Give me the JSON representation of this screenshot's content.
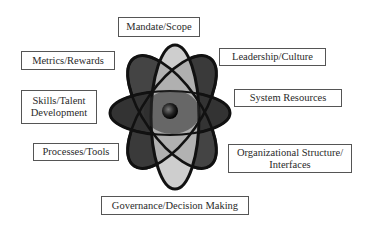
{
  "diagram": {
    "type": "atom-model",
    "center_element": "atom-icon",
    "labels": [
      {
        "id": "mandate",
        "lines": [
          "Mandate/Scope"
        ]
      },
      {
        "id": "metrics",
        "lines": [
          "Metrics/Rewards"
        ]
      },
      {
        "id": "leadership",
        "lines": [
          "Leadership/Culture"
        ]
      },
      {
        "id": "skills",
        "lines": [
          "Skills/Talent",
          "Development"
        ]
      },
      {
        "id": "system",
        "lines": [
          "System Resources"
        ]
      },
      {
        "id": "processes",
        "lines": [
          "Processes/Tools"
        ]
      },
      {
        "id": "org",
        "lines": [
          "Organizational Structure/",
          "Interfaces"
        ]
      },
      {
        "id": "governance",
        "lines": [
          "Governance/Decision Making"
        ]
      }
    ],
    "colors": {
      "dark_orbit": "#3c3c3c",
      "mid_orbit": "#5a5a5a",
      "light_orbit": "#c8c8c8",
      "outline": "#111111",
      "box_border": "#555555",
      "text": "#2a2a2a"
    }
  }
}
